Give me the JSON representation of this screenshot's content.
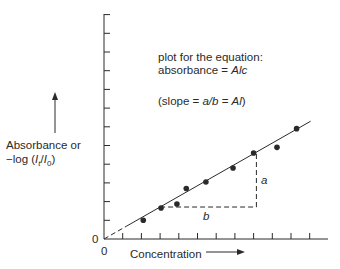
{
  "chart_data": {
    "type": "scatter",
    "title": "",
    "xlabel": "Concentration",
    "ylabel": "Absorbance or −log (It/I0)",
    "ylabel_line1": "Absorbance or",
    "ylabel_line2_prefix": "−log (",
    "ylabel_line2_It": "I",
    "ylabel_line2_It_sub": "t",
    "ylabel_line2_sep": "/",
    "ylabel_line2_I0": "I",
    "ylabel_line2_I0_sub": "0",
    "ylabel_line2_suffix": ")",
    "origin_x_label": "0",
    "origin_y_label": "0",
    "x_tick_count": 11,
    "y_tick_count": 12,
    "tick_labels_shown": false,
    "xlim": [
      0,
      11.8
    ],
    "ylim": [
      0,
      12
    ],
    "grid": false,
    "legend": null,
    "annotations": {
      "equation_line1": "plot for the equation:",
      "equation_line2_prefix": "absorbance = ",
      "equation_line2_italic": "Alc",
      "slope_prefix": "(slope = ",
      "slope_italic_1": "a/b",
      "slope_mid": " = ",
      "slope_italic_2": "Al",
      "slope_suffix": ")",
      "triangle_vertical_label": "a",
      "triangle_horizontal_label": "b"
    },
    "series": [
      {
        "name": "measured points",
        "style": "filled-circle",
        "x": [
          2.1,
          3.05,
          3.9,
          4.4,
          5.45,
          6.9,
          8.0,
          9.25,
          10.3
        ],
        "y": [
          1.0,
          1.66,
          1.87,
          2.7,
          3.05,
          3.8,
          4.6,
          4.9,
          5.9
        ]
      }
    ],
    "fit_line": {
      "slope": 0.57,
      "intercept": 0,
      "solid_from_x": 1.2,
      "to_x": 11.05,
      "dashed_from_x": 0,
      "dashed_to_x": 1.2
    },
    "slope_triangle": {
      "x_start": 3.0,
      "x_end": 8.15,
      "y_base": 1.71,
      "y_top": 4.6
    }
  },
  "colors": {
    "ink": "#2a2a2a",
    "background": "#ffffff"
  }
}
